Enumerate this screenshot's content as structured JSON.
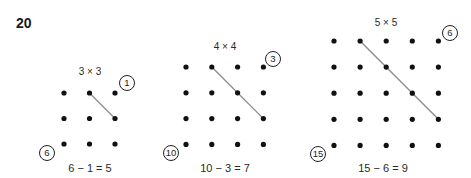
{
  "exercise_number": "20",
  "grids": [
    {
      "size_label": "3 × 3",
      "n": 3,
      "top_right_count": "1",
      "bottom_left_count": "6",
      "equation": "6 − 1 = 5",
      "origin": [
        64,
        93
      ],
      "spacing": 25.5,
      "diagonal": {
        "from": [
          1,
          0
        ],
        "to": [
          2,
          1
        ]
      },
      "label_pos": [
        90,
        66
      ],
      "top_circle": [
        127,
        83
      ],
      "bottom_circle": [
        47,
        153
      ],
      "eq_pos": [
        90,
        162
      ]
    },
    {
      "size_label": "4 × 4",
      "n": 4,
      "top_right_count": "3",
      "bottom_left_count": "10",
      "equation": "10 − 3 = 7",
      "origin": [
        186,
        67
      ],
      "spacing": 25.8,
      "diagonal": {
        "from": [
          1,
          0
        ],
        "to": [
          3,
          2
        ]
      },
      "label_pos": [
        225,
        41
      ],
      "top_circle": [
        273,
        59
      ],
      "bottom_circle": [
        171,
        153
      ],
      "eq_pos": [
        225,
        162
      ]
    },
    {
      "size_label": "5 × 5",
      "n": 5,
      "top_right_count": "6",
      "bottom_left_count": "15",
      "equation": "15 − 6 = 9",
      "origin": [
        334,
        41
      ],
      "spacing": 26.1,
      "diagonal": {
        "from": [
          1,
          0
        ],
        "to": [
          4,
          3
        ]
      },
      "label_pos": [
        386,
        17
      ],
      "top_circle": [
        450,
        33
      ],
      "bottom_circle": [
        318,
        154
      ],
      "eq_pos": [
        383,
        162
      ]
    }
  ],
  "colors": {
    "dot": "#111111",
    "diagonal_line": "#8a8a8a",
    "text": "#2a2a2a"
  }
}
